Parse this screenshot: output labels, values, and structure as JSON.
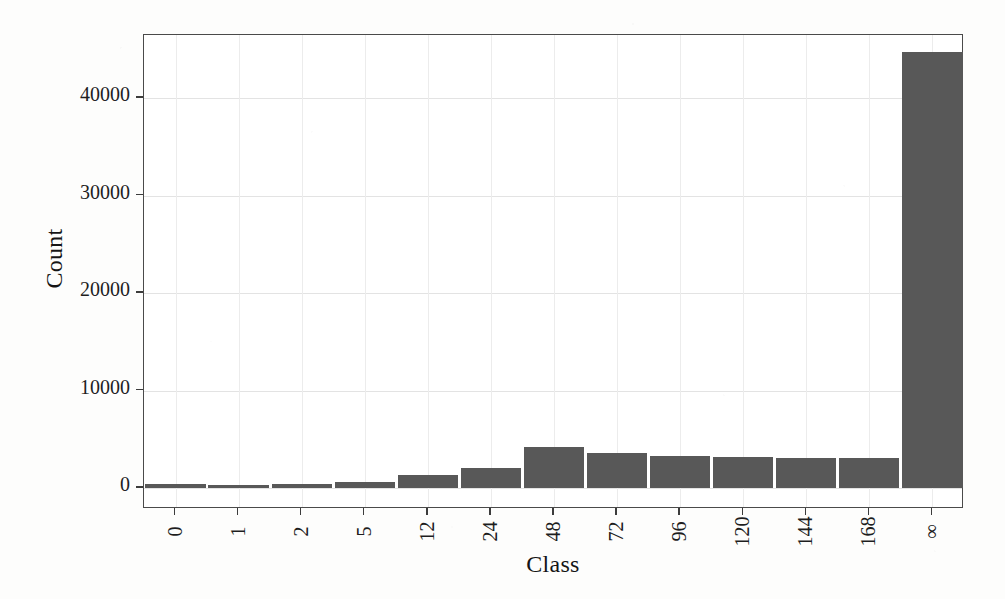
{
  "chart_data": {
    "type": "bar",
    "title": "",
    "subtitle": "",
    "xlabel": "Class",
    "ylabel": "Count",
    "categories": [
      "0",
      "1",
      "2",
      "5",
      "12",
      "24",
      "48",
      "72",
      "96",
      "120",
      "144",
      "168",
      "∞"
    ],
    "values": [
      400,
      300,
      400,
      600,
      1300,
      2100,
      4200,
      3600,
      3300,
      3200,
      3100,
      3100,
      44700
    ],
    "series": [
      {
        "name": "Count",
        "values": [
          400,
          300,
          400,
          600,
          1300,
          2100,
          4200,
          3600,
          3300,
          3200,
          3100,
          3100,
          44700
        ]
      }
    ],
    "ylim": [
      0,
      48700
    ],
    "xlim_note": "categorical, 13 bars",
    "ytick_labels": [
      "0",
      "10000",
      "20000",
      "30000",
      "40000"
    ],
    "ytick_values": [
      0,
      10000,
      20000,
      30000,
      40000
    ],
    "xtick_labels": [
      "0",
      "1",
      "2",
      "5",
      "12",
      "24",
      "48",
      "72",
      "96",
      "120",
      "144",
      "168",
      "∞"
    ],
    "grid": true,
    "grid_axis": "both",
    "legend": false,
    "legend_position": "none",
    "bar_color": "#585858",
    "frame_color": "#4a4a4a",
    "background_color": "#ffffff",
    "xtick_label_rotation_deg": -90,
    "annotations": []
  },
  "figure": {
    "y_axis_title": "Count",
    "x_axis_title": "Class"
  }
}
